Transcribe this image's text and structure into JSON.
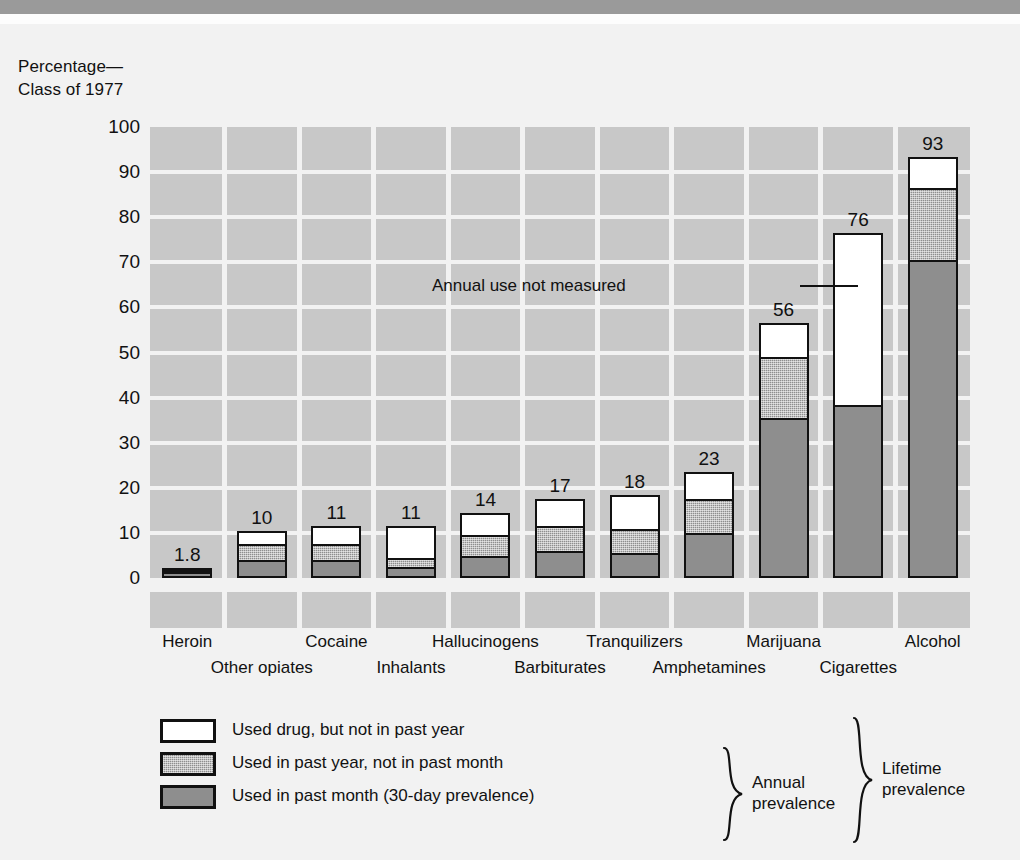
{
  "caption": "Percentage—\nClass of 1977",
  "colors": {
    "plot_background": "#c8c8c8",
    "page_background": "#f2f2f2",
    "gridline": "#f2f2f2",
    "segment_white": "#ffffff",
    "segment_annual": "#8e8e8e",
    "segment_month": "#8e8e8e",
    "outline": "#111111"
  },
  "annotation": {
    "text": "Annual use not measured"
  },
  "legend": {
    "items": [
      {
        "swatch": "white",
        "label": "Used drug, but not in past year"
      },
      {
        "swatch": "mid",
        "label": "Used in past year, not in past month"
      },
      {
        "swatch": "low",
        "label": "Used in past month (30-day prevalence)"
      }
    ],
    "brace_annual": "Annual\nprevalence",
    "brace_lifetime": "Lifetime\nprevalence"
  },
  "chart_data": {
    "type": "bar",
    "title": "",
    "subtitle": "",
    "xlabel": "",
    "ylabel": "Percentage—Class of 1977",
    "ylim": [
      0,
      100
    ],
    "yticks": [
      0,
      10,
      20,
      30,
      40,
      50,
      60,
      70,
      80,
      90,
      100
    ],
    "ytick_labels": [
      "0",
      "10",
      "20",
      "30",
      "40",
      "50",
      "60",
      "70",
      "80",
      "90",
      "100"
    ],
    "grid": true,
    "stacked": true,
    "legend_position": "below-plot",
    "categories": [
      "Heroin",
      "Other opiates",
      "Cocaine",
      "Inhalants",
      "Hallucinogens",
      "Barbiturates",
      "Tranquilizers",
      "Amphetamines",
      "Marijuana",
      "Cigarettes",
      "Alcohol"
    ],
    "total_labels": [
      "1.8",
      "10",
      "11",
      "11",
      "14",
      "17",
      "18",
      "23",
      "56",
      "76",
      "93"
    ],
    "series": [
      {
        "name": "Used in past month (30-day prevalence)",
        "key": "past_month",
        "color": "#8e8e8e",
        "values": [
          0.8,
          3.5,
          3.5,
          2.0,
          4.5,
          5.5,
          5.0,
          9.5,
          35.0,
          38.0,
          70.0
        ]
      },
      {
        "name": "Used in past year, not in past month",
        "key": "past_year_not_month",
        "color": "#8e8e8e",
        "values": [
          0.6,
          3.5,
          3.5,
          2.0,
          4.5,
          5.5,
          5.5,
          7.5,
          13.5,
          0,
          16.0
        ]
      },
      {
        "name": "Used drug, but not in past year",
        "key": "not_past_year",
        "color": "#ffffff",
        "values": [
          0.4,
          3.0,
          4.0,
          7.0,
          5.0,
          6.0,
          7.5,
          6.0,
          7.5,
          38.0,
          7.0
        ]
      }
    ],
    "totals": [
      1.8,
      10,
      11,
      11,
      14,
      17,
      18,
      23,
      56,
      76,
      93
    ],
    "notes": [
      "Cigarettes: annual use not measured — bar has no middle (annual, not past month) segment."
    ]
  }
}
